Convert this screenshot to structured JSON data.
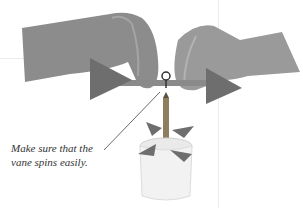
{
  "caption": {
    "line1": "Make sure that the",
    "line2": "vane spins easily."
  },
  "illustration": {
    "subject": "hands assembling a wind vane on a pencil in a paper cup",
    "colors": {
      "skin": "#8a8a8a",
      "vane": "#6e6e6e",
      "cup": "#f2f2f2",
      "pencil": "#8f7d60"
    }
  }
}
